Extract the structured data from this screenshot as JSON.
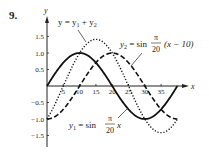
{
  "problem_number": "9.",
  "chart_data": {
    "type": "line",
    "title": "",
    "xlabel": "x",
    "ylabel": "y",
    "xlim": [
      0,
      42
    ],
    "ylim": [
      -1.7,
      1.8
    ],
    "x_ticks": [
      5,
      10,
      15,
      20,
      25,
      30,
      35
    ],
    "y_ticks": [
      1.5,
      1.0,
      0.5,
      -0.5,
      -1.0,
      -1.5
    ],
    "x_tick_labels": [
      "5",
      "10",
      "15",
      "20",
      "25",
      "30",
      "35"
    ],
    "y_tick_labels": [
      "1.5",
      "1.0",
      "0.5",
      "−0.5",
      "−1.0",
      "−1.5"
    ],
    "grid": false,
    "legend": "inline annotations with leader lines",
    "series": [
      {
        "name": "y1 = sin(π/20 x)",
        "style": "solid",
        "domain": [
          0,
          40
        ],
        "x": [
          0,
          5,
          10,
          15,
          20,
          25,
          30,
          35,
          40
        ],
        "values": [
          0,
          0.707,
          1,
          0.707,
          0,
          -0.707,
          -1,
          -0.707,
          0
        ]
      },
      {
        "name": "y2 = sin(π/20 (x − 10))",
        "style": "dashed",
        "domain": [
          0,
          40
        ],
        "x": [
          0,
          5,
          10,
          15,
          20,
          25,
          30,
          35,
          40
        ],
        "values": [
          -1,
          -0.707,
          0,
          0.707,
          1,
          0.707,
          0,
          -0.707,
          -1
        ]
      },
      {
        "name": "y = y1 + y2",
        "style": "dotted",
        "domain": [
          0,
          40
        ],
        "x": [
          0,
          5,
          10,
          15,
          20,
          25,
          30,
          35,
          40
        ],
        "values": [
          -1,
          0,
          1,
          1.414,
          1,
          0,
          -1,
          -1.414,
          -1
        ]
      }
    ]
  },
  "annotations": {
    "sum": {
      "lhs": "y = y",
      "sub1": "1",
      "plus": " + y",
      "sub2": "2"
    },
    "y2": {
      "lhs": "y",
      "sub": "2",
      "eq": " = sin ",
      "num": "π",
      "den": "20",
      "arg": "(x − 10)"
    },
    "y1": {
      "lhs": "y",
      "sub": "1",
      "eq": " = sin ",
      "num": "π",
      "den": "20",
      "arg": "x"
    }
  }
}
